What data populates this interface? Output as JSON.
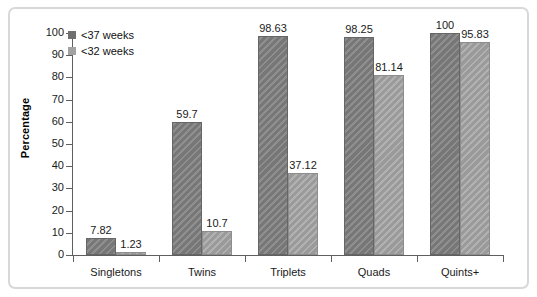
{
  "chart_data": {
    "type": "bar",
    "title": "",
    "xlabel": "",
    "ylabel": "Percentage",
    "ylim": [
      0,
      100
    ],
    "yticks": [
      0,
      10,
      20,
      30,
      40,
      50,
      60,
      70,
      80,
      90,
      100
    ],
    "ytick_labels": [
      "0",
      "10",
      "20",
      "30",
      "40",
      "50",
      "60",
      "70",
      "80",
      "90",
      "100"
    ],
    "grid": false,
    "legend_position": "top-left",
    "categories": [
      "Singletons",
      "Twins",
      "Triplets",
      "Quads",
      "Quints+"
    ],
    "series": [
      {
        "name": "<37 weeks",
        "color": "#7e7e7e",
        "values": [
          7.82,
          59.7,
          98.63,
          98.25,
          100
        ],
        "labels": [
          "7.82",
          "59.7",
          "98.63",
          "98.25",
          "100"
        ]
      },
      {
        "name": "<32 weeks",
        "color": "#a2a2a2",
        "values": [
          1.23,
          10.7,
          37.12,
          81.14,
          95.83
        ],
        "labels": [
          "1.23",
          "10.7",
          "37.12",
          "81.14",
          "95.83"
        ]
      }
    ]
  },
  "legend": {
    "items": [
      {
        "label": "<37 weeks",
        "swatch": "dark"
      },
      {
        "label": "<32 weeks",
        "swatch": "light"
      }
    ]
  },
  "axis": {
    "y_title": "Percentage"
  },
  "colors": {
    "series_dark": "#7e7e7e",
    "series_light": "#a2a2a2",
    "axis": "#5f5f5f",
    "frame": "#d8d8d8",
    "text": "#1a1a1a",
    "background": "#ffffff"
  }
}
